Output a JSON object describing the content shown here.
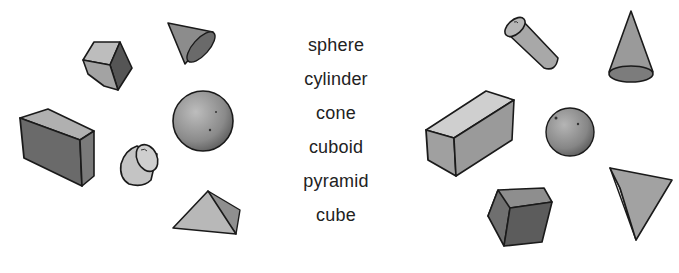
{
  "word_list": {
    "items": [
      {
        "label": "sphere"
      },
      {
        "label": "cylinder"
      },
      {
        "label": "cone"
      },
      {
        "label": "cuboid"
      },
      {
        "label": "pyramid"
      },
      {
        "label": "cube"
      }
    ]
  },
  "left_group": {
    "shapes": [
      "cube",
      "cone",
      "cuboid",
      "sphere",
      "cylinder",
      "pyramid"
    ]
  },
  "right_group": {
    "shapes": [
      "cylinder",
      "cone",
      "cuboid",
      "sphere",
      "cube",
      "pyramid"
    ]
  },
  "colors": {
    "outline": "#1a1a1a",
    "light_face": "#bdbdbd",
    "mid_face": "#9a9a9a",
    "dark_face": "#6e6e6e",
    "text": "#222222"
  }
}
